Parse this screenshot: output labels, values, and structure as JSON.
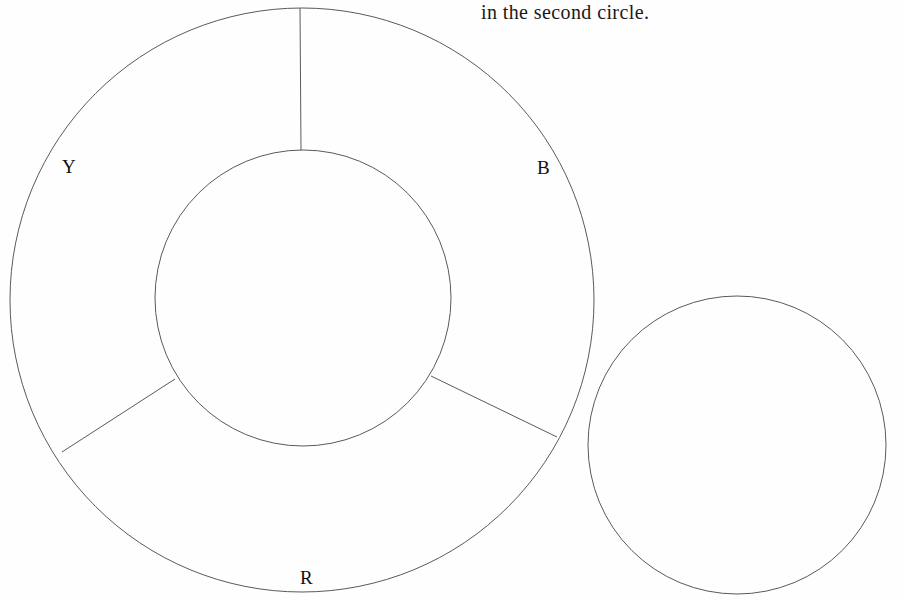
{
  "page": {
    "background_color": "#fefefe",
    "width": 903,
    "height": 601
  },
  "caption": {
    "text": "in the second circle.",
    "x": 481,
    "y": 2,
    "font_size": 20,
    "color": "#1a1a1a"
  },
  "stroke": {
    "color": "#5a5a5a",
    "width": 1
  },
  "diagram": {
    "outer_ring": {
      "name": "outer-circle",
      "cx": 302,
      "cy": 300,
      "r": 292
    },
    "inner_ring": {
      "name": "inner-circle",
      "cx": 303,
      "cy": 298,
      "r": 148
    },
    "second_circle": {
      "name": "second-circle",
      "cx": 737,
      "cy": 445,
      "r": 149
    },
    "spokes": [
      {
        "name": "spoke-top",
        "angle_deg": 270,
        "x1": 301,
        "y1": 150,
        "x2": 300,
        "y2": 8
      },
      {
        "name": "spoke-lower-left",
        "angle_deg": 150,
        "x1": 175,
        "y1": 379,
        "x2": 62,
        "y2": 452
      },
      {
        "name": "spoke-lower-right",
        "angle_deg": 30,
        "x1": 431,
        "y1": 376,
        "x2": 557,
        "y2": 437
      }
    ],
    "sector_labels": [
      {
        "name": "sector-label-y",
        "text": "Y",
        "x": 62,
        "y": 157
      },
      {
        "name": "sector-label-b",
        "text": "B",
        "x": 537,
        "y": 158
      },
      {
        "name": "sector-label-r",
        "text": "R",
        "x": 300,
        "y": 568
      }
    ]
  }
}
